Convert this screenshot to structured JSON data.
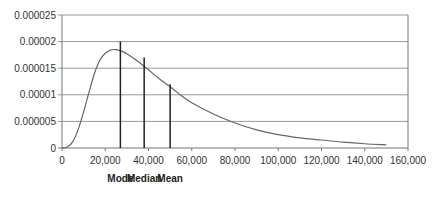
{
  "chart_data": {
    "type": "line",
    "title": "",
    "xlabel": "",
    "ylabel": "",
    "xlim": [
      0,
      160000
    ],
    "ylim": [
      0,
      2.5e-05
    ],
    "x_ticks": [
      "0",
      "20,000",
      "40,000",
      "60,000",
      "80,000",
      "100,000",
      "120,000",
      "140,000",
      "160,000"
    ],
    "y_ticks": [
      "0",
      "0.000005",
      "0.00001",
      "0.000015",
      "0.00002",
      "0.000025"
    ],
    "grid": {
      "horizontal": true,
      "vertical": false
    },
    "series": [
      {
        "name": "density",
        "x": [
          0,
          2500,
          5000,
          7500,
          10000,
          12500,
          15000,
          17500,
          20000,
          22500,
          25000,
          27500,
          30000,
          35000,
          40000,
          45000,
          50000,
          55000,
          60000,
          70000,
          80000,
          90000,
          100000,
          110000,
          120000,
          130000,
          140000,
          150000
        ],
        "values": [
          0,
          2e-07,
          1.2e-06,
          3.5e-06,
          6.8e-06,
          1.05e-05,
          1.4e-05,
          1.65e-05,
          1.78e-05,
          1.84e-05,
          1.85e-05,
          1.82e-05,
          1.77e-05,
          1.63e-05,
          1.47e-05,
          1.3e-05,
          1.15e-05,
          9.9e-06,
          8.5e-06,
          6.4e-06,
          4.7e-06,
          3.4e-06,
          2.5e-06,
          1.9e-06,
          1.5e-06,
          1.1e-06,
          8e-07,
          6e-07
        ]
      }
    ],
    "markers": [
      {
        "label": "Mode",
        "x": 27000,
        "height": 2e-05
      },
      {
        "label": "Median",
        "x": 38000,
        "height": 1.7e-05
      },
      {
        "label": "Mean",
        "x": 50000,
        "height": 1.2e-05
      }
    ],
    "colors": {
      "line": "#666666",
      "grid": "#999999",
      "marker": "#222222",
      "axis": "#777777"
    }
  }
}
